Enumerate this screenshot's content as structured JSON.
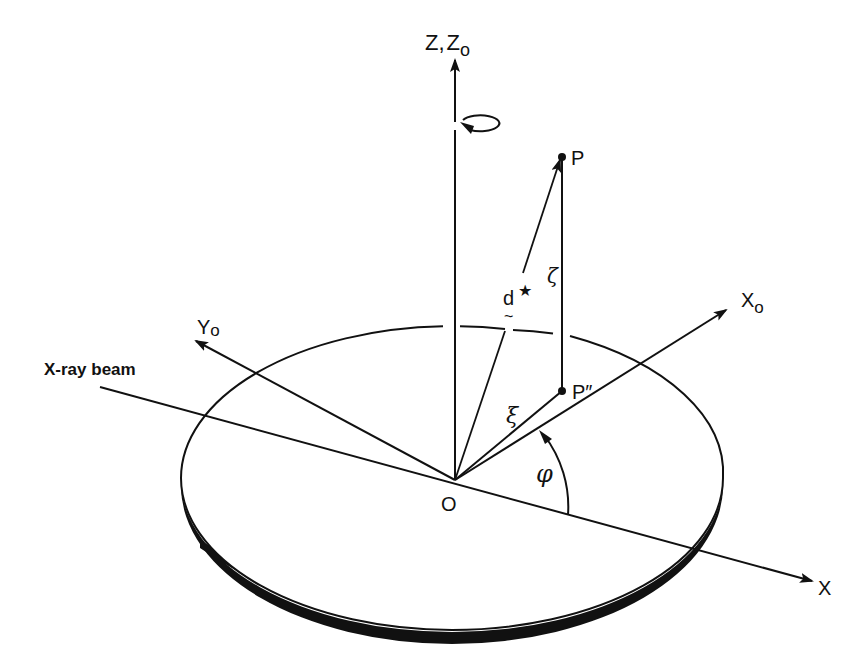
{
  "figure": {
    "type": "3D coordinate geometry diagram",
    "background": "#ffffff",
    "ink_color": "#111111"
  },
  "labels": {
    "z_axis": "Z,",
    "z_axis_main": "Z",
    "z_axis_sep": ",",
    "z0_axis_base": "Z",
    "z0_axis_sub": "o",
    "x_axis": "X",
    "x0_axis_base": "X",
    "x0_axis_sub": "o",
    "y0_axis_base": "Y",
    "y0_axis_sub": "o",
    "xray_beam": "X-ray beam",
    "origin": "O",
    "point_p": "P",
    "point_p_proj": "P″",
    "vector_d": "d",
    "vector_d_tilde": "~",
    "star": "★",
    "zeta": "ζ",
    "xi": "ξ",
    "phi": "φ"
  },
  "elements": {
    "origin": {
      "x": 455,
      "y": 480
    },
    "z_axis_tip": {
      "x": 455,
      "y": 60
    },
    "x_axis_tip": {
      "x": 812,
      "y": 581
    },
    "x0_axis_tip": {
      "x": 726,
      "y": 310
    },
    "y0_axis_tip": {
      "x": 195,
      "y": 341
    },
    "beam_start": {
      "x": 100,
      "y": 387
    },
    "point_p": {
      "x": 562,
      "y": 157
    },
    "point_p_proj": {
      "x": 562,
      "y": 391
    },
    "disk": {
      "cx": 452,
      "cy": 478,
      "rx": 271,
      "ry": 152,
      "thickness": 10
    }
  },
  "icons": {
    "rotation_arrow": "rotation-circle-arrow",
    "star_marker": "star"
  }
}
